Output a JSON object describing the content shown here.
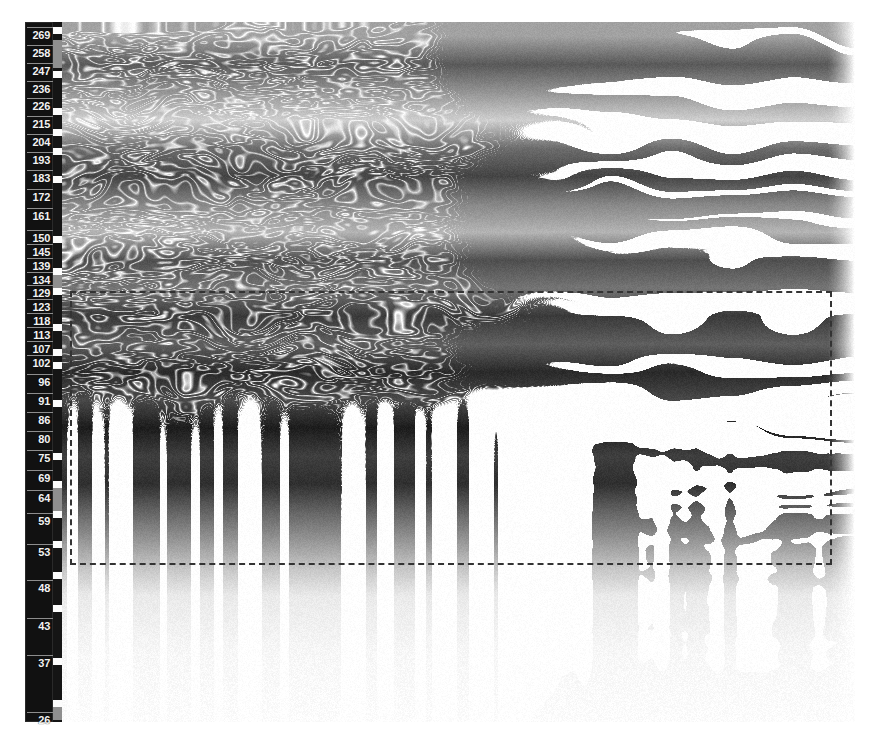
{
  "figure": {
    "type": "grayscale-heatmap",
    "title": "",
    "background_color": "#ffffff",
    "foreground_color": "#111111",
    "roi_color": "#333333"
  },
  "axis": {
    "name": "vertical-position-ruler",
    "orientation": "vertical",
    "direction": "descending",
    "label_color": "#f2f2f2",
    "background_color": "#111111",
    "min": 26,
    "max": 269,
    "ticks": [
      {
        "label": "269",
        "y": 34
      },
      {
        "label": "258",
        "y": 52
      },
      {
        "label": "247",
        "y": 70
      },
      {
        "label": "236",
        "y": 88
      },
      {
        "label": "226",
        "y": 105
      },
      {
        "label": "215",
        "y": 123
      },
      {
        "label": "204",
        "y": 141
      },
      {
        "label": "193",
        "y": 159
      },
      {
        "label": "183",
        "y": 177
      },
      {
        "label": "172",
        "y": 196
      },
      {
        "label": "161",
        "y": 215
      },
      {
        "label": "150",
        "y": 237
      },
      {
        "label": "145",
        "y": 251
      },
      {
        "label": "139",
        "y": 265
      },
      {
        "label": "134",
        "y": 279
      },
      {
        "label": "129",
        "y": 292
      },
      {
        "label": "123",
        "y": 306
      },
      {
        "label": "118",
        "y": 320
      },
      {
        "label": "113",
        "y": 334
      },
      {
        "label": "107",
        "y": 348
      },
      {
        "label": "102",
        "y": 362
      },
      {
        "label": "96",
        "y": 381
      },
      {
        "label": "91",
        "y": 400
      },
      {
        "label": "86",
        "y": 419
      },
      {
        "label": "80",
        "y": 438
      },
      {
        "label": "75",
        "y": 457
      },
      {
        "label": "69",
        "y": 477
      },
      {
        "label": "64",
        "y": 497
      },
      {
        "label": "59",
        "y": 520
      },
      {
        "label": "53",
        "y": 551
      },
      {
        "label": "48",
        "y": 587
      },
      {
        "label": "43",
        "y": 625
      },
      {
        "label": "37",
        "y": 662
      },
      {
        "label": "26",
        "y": 719
      }
    ]
  },
  "track": {
    "name": "sequence-tick-track",
    "background_color": "#151515",
    "mark_color": "#fdfdfd",
    "marks_y": [
      27,
      71,
      108,
      129,
      148,
      176,
      236,
      268,
      288,
      324,
      349,
      362,
      400,
      453,
      481,
      511,
      541,
      572,
      605,
      658,
      700
    ],
    "grey_bands": [
      {
        "y": 40,
        "h": 28
      },
      {
        "y": 268,
        "h": 26
      },
      {
        "y": 487,
        "h": 24
      },
      {
        "y": 700,
        "h": 20
      }
    ]
  },
  "roi": {
    "name": "region-of-interest",
    "style": "dashed",
    "color": "#333333",
    "left": 70,
    "top": 291,
    "width": 762,
    "height": 274,
    "label": ""
  },
  "chart_data": {
    "type": "heatmap",
    "title": "",
    "xlabel": "",
    "ylabel": "",
    "colormap": "gray",
    "value_range": [
      0,
      1
    ],
    "grid": false,
    "legend": "none",
    "ylim": [
      26,
      269
    ],
    "ytick_labels": [
      "269",
      "258",
      "247",
      "236",
      "226",
      "215",
      "204",
      "193",
      "183",
      "172",
      "161",
      "150",
      "145",
      "139",
      "134",
      "129",
      "123",
      "118",
      "113",
      "107",
      "102",
      "96",
      "91",
      "86",
      "80",
      "75",
      "69",
      "64",
      "59",
      "53",
      "48",
      "43",
      "37",
      "26"
    ],
    "band_rows": [
      {
        "y": 0.02,
        "intensity": 0.35,
        "wave": 0.3
      },
      {
        "y": 0.06,
        "intensity": 0.62,
        "wave": 0.45
      },
      {
        "y": 0.1,
        "intensity": 0.4,
        "wave": 0.25
      },
      {
        "y": 0.14,
        "intensity": 0.18,
        "wave": 0.55
      },
      {
        "y": 0.18,
        "intensity": 0.55,
        "wave": 0.4
      },
      {
        "y": 0.22,
        "intensity": 0.7,
        "wave": 0.6
      },
      {
        "y": 0.26,
        "intensity": 0.45,
        "wave": 0.35
      },
      {
        "y": 0.3,
        "intensity": 0.28,
        "wave": 0.5
      },
      {
        "y": 0.34,
        "intensity": 0.66,
        "wave": 0.65
      },
      {
        "y": 0.38,
        "intensity": 0.52,
        "wave": 0.3
      },
      {
        "y": 0.42,
        "intensity": 0.74,
        "wave": 0.7
      },
      {
        "y": 0.46,
        "intensity": 0.6,
        "wave": 0.45
      },
      {
        "y": 0.5,
        "intensity": 0.8,
        "wave": 0.55
      },
      {
        "y": 0.54,
        "intensity": 0.68,
        "wave": 0.6
      },
      {
        "y": 0.58,
        "intensity": 0.85,
        "wave": 0.75
      },
      {
        "y": 0.62,
        "intensity": 0.72,
        "wave": 0.5
      },
      {
        "y": 0.66,
        "intensity": 0.78,
        "wave": 0.65
      },
      {
        "y": 0.7,
        "intensity": 0.58,
        "wave": 0.8
      },
      {
        "y": 0.74,
        "intensity": 0.4,
        "wave": 0.45
      },
      {
        "y": 0.78,
        "intensity": 0.22,
        "wave": 0.3
      },
      {
        "y": 0.82,
        "intensity": 0.08,
        "wave": 0.2
      },
      {
        "y": 0.9,
        "intensity": 0.03,
        "wave": 0.1
      },
      {
        "y": 1.0,
        "intensity": 0.01,
        "wave": 0.05
      }
    ]
  }
}
